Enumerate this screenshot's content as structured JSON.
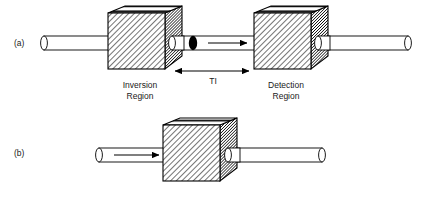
{
  "figure": {
    "background_color": "#ffffff",
    "line_color": "#000000",
    "text_color": "#1a1a1a"
  },
  "panels": [
    {
      "id": "a",
      "label": "(a)",
      "label_x": 14,
      "label_y": 45,
      "boxes": [
        {
          "name": "inversion-region-box",
          "label_line1": "Inversion",
          "label_line2": "Region",
          "label_cx": 143,
          "label_line1_y": 87,
          "label_line2_y": 97
        },
        {
          "name": "detection-region-box",
          "label_line1": "Detection",
          "label_line2": "Region",
          "label_cx": 286,
          "label_line1_y": 87,
          "label_line2_y": 97
        }
      ],
      "measure": {
        "name": "ti-measure",
        "label": "TI",
        "label_x": 213,
        "label_y": 82,
        "arrow_y": 71,
        "x_start": 174,
        "x_end": 250
      },
      "bolus": {
        "name": "labeled-bolus",
        "cx": 193,
        "cy": 43,
        "rx": 4.2,
        "ry": 7.2,
        "color": "#000000"
      },
      "flow_arrow": {
        "name": "flow-arrow-a",
        "x_start": 208,
        "x_end": 248,
        "y": 43,
        "direction": "right"
      }
    },
    {
      "id": "b",
      "label": "(b)",
      "label_x": 14,
      "label_y": 155,
      "boxes": [
        {
          "name": "detection-region-box-b",
          "label_line1": "",
          "label_line2": "",
          "label_cx": 0,
          "label_line1_y": 0,
          "label_line2_y": 0
        }
      ],
      "flow_arrow": {
        "name": "flow-arrow-b",
        "x_start": 113,
        "x_end": 160,
        "y": 155,
        "direction": "right"
      }
    }
  ],
  "annotations": {
    "ti_meaning": "TI",
    "panel_a_letter": "(a)",
    "panel_b_letter": "(b)",
    "inversion_region": "Inversion Region",
    "detection_region": "Detection Region"
  }
}
